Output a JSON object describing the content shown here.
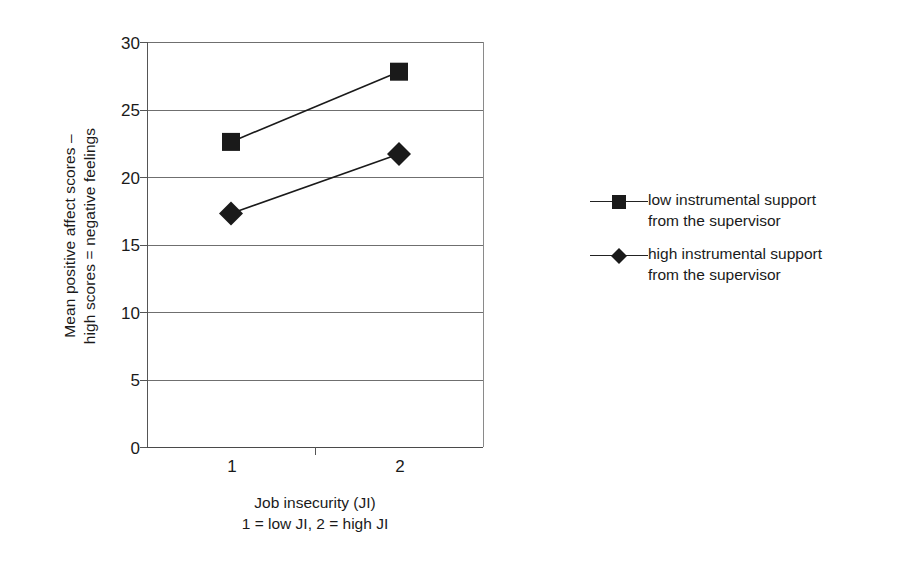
{
  "chart_data": {
    "type": "line",
    "title": "",
    "xlabel": "Job insecurity (JI)",
    "xlabel_note": "1 = low JI, 2 = high JI",
    "ylabel_line1": "Mean positive affect scores –",
    "ylabel_line2": "high scores = negative feelings",
    "categories": [
      "1",
      "2"
    ],
    "x": [
      1,
      2
    ],
    "xlim": [
      0.5,
      2.5
    ],
    "ylim": [
      0,
      30
    ],
    "yticks": [
      0,
      5,
      10,
      15,
      20,
      25,
      30
    ],
    "ytick_labels": [
      "0",
      "5",
      "10",
      "15",
      "20",
      "25",
      "30"
    ],
    "grid": "horizontal",
    "legend_position": "right",
    "series": [
      {
        "name": "low instrumental support from the supervisor",
        "name_line1": "low instrumental support",
        "name_line2": "from the supervisor",
        "marker": "square",
        "color": "#1a1a1a",
        "values": [
          22.6,
          27.8
        ]
      },
      {
        "name": "high instrumental support from the supervisor",
        "name_line1": "high instrumental support",
        "name_line2": "from the supervisor",
        "marker": "diamond",
        "color": "#1a1a1a",
        "values": [
          17.3,
          21.7
        ]
      }
    ]
  }
}
